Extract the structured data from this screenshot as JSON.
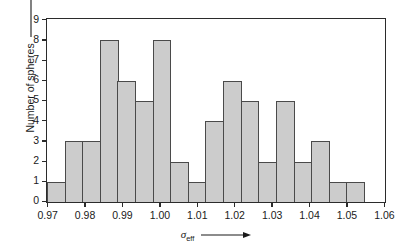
{
  "chart_data": {
    "type": "bar",
    "title": "",
    "subtitle": "",
    "xlabel": "σ_eff",
    "xlabel_symbol": "σ",
    "xlabel_subscript": "eff",
    "ylabel": "Number of spheres",
    "xlim": [
      0.97,
      1.06
    ],
    "ylim": [
      0,
      9
    ],
    "grid": false,
    "legend": null,
    "bin_width": 0.005,
    "bin_edges": [
      0.97,
      0.975,
      0.98,
      0.985,
      0.99,
      0.995,
      1.0,
      1.005,
      1.01,
      1.015,
      1.02,
      1.025,
      1.03,
      1.035,
      1.04,
      1.045,
      1.05,
      1.055,
      1.06
    ],
    "categories": [
      "0.970-0.975",
      "0.975-0.980",
      "0.980-0.985",
      "0.985-0.990",
      "0.990-0.995",
      "0.995-1.000",
      "1.000-1.005",
      "1.005-1.010",
      "1.010-1.015",
      "1.015-1.020",
      "1.020-1.025",
      "1.025-1.030",
      "1.030-1.035",
      "1.035-1.040",
      "1.040-1.045",
      "1.045-1.050",
      "1.050-1.055",
      "1.055-1.060"
    ],
    "values": [
      1,
      3,
      3,
      8,
      6,
      5,
      8,
      2,
      1,
      4,
      6,
      5,
      2,
      5,
      2,
      3,
      1,
      1
    ],
    "bar_color": "#cccccc",
    "bar_edge_color": "#4a4a4a",
    "axis_color": "#2b2b2b"
  },
  "axes": {
    "y_ticks": [
      "0",
      "1",
      "2",
      "3",
      "4",
      "5",
      "6",
      "7",
      "8",
      "9"
    ],
    "x_ticks": [
      "0.97",
      "0.98",
      "0.99",
      "1.00",
      "1.01",
      "1.02",
      "1.03",
      "1.04",
      "1.05",
      "1.06"
    ],
    "y_title": "Number of spheres",
    "x_title_symbol": "σ",
    "x_title_subscript": "eff"
  }
}
